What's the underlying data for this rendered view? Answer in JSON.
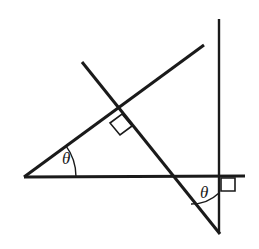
{
  "figure": {
    "kind": "geometry-diagram",
    "width": 259,
    "height": 249,
    "background_color": "#ffffff",
    "stroke_color": "#1a1a1a",
    "stroke_width": 2.6,
    "thin_stroke_width": 1.3
  },
  "labels": {
    "theta_upper": {
      "text": "θ",
      "x": 62,
      "y": 150
    },
    "theta_lower": {
      "text": "θ",
      "x": 200,
      "y": 184
    }
  },
  "geometry": {
    "horizontal_line": {
      "name": "horizontal-baseline",
      "x1": 24,
      "y1": 177,
      "x2": 245,
      "y2": 176
    },
    "ascending_line": {
      "name": "ascending-transversal",
      "x1": 24,
      "y1": 177,
      "x2": 204,
      "y2": 45
    },
    "descending_line": {
      "name": "descending-transversal",
      "x1": 82,
      "y1": 62,
      "x2": 220,
      "y2": 234
    },
    "vertical_line": {
      "name": "vertical-line",
      "x1": 219,
      "y1": 19,
      "x2": 219,
      "y2": 233
    },
    "perpendicular_intersection": {
      "x": 117,
      "y": 107
    },
    "baseline_crossing": {
      "x": 172,
      "y": 176
    },
    "bottom_vertex": {
      "x": 219,
      "y": 233
    },
    "right_angle_marker_diagonals": {
      "name": "right-angle-square-at-diagonals",
      "points": "122,114 132,126 120,135 110,123"
    },
    "right_angle_marker_axes": {
      "name": "right-angle-square-at-axes",
      "points": "221,178 235,178 235,191 221,191"
    },
    "angle_arc_upper": {
      "name": "theta-arc-upper",
      "path": "M 76,176.7 A 52,52 0 0 0 65.8,145.7"
    },
    "angle_arc_lower": {
      "name": "theta-arc-lower",
      "path": "M 219,193 A 40,40 0 0 1 191,204"
    }
  }
}
